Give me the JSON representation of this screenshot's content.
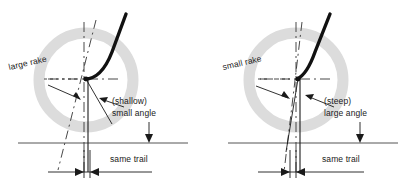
{
  "figure": {
    "type": "technical-line-diagram",
    "panels": [
      {
        "id": "left",
        "name": "large-rake-shallow-angle",
        "labels": {
          "rake": "large rake",
          "angle_line1": "(shallow)",
          "angle_line2": "small angle",
          "trail": "same trail"
        }
      },
      {
        "id": "right",
        "name": "small-rake-steep-angle",
        "labels": {
          "rake": "small rake",
          "angle_line1": "(steep)",
          "angle_line2": "large angle",
          "trail": "same trail"
        }
      }
    ],
    "colors": {
      "wheel": "#dcdcdc",
      "ink": "#1a1a1a",
      "thin_line": "#333333",
      "ground": "#555555"
    }
  }
}
